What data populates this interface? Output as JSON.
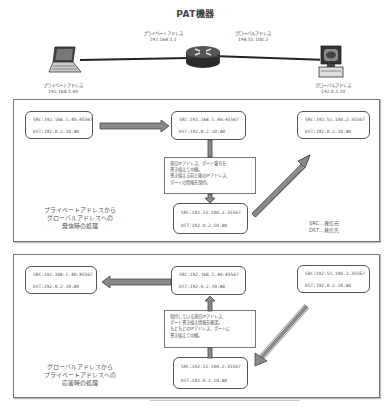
{
  "title": "PAT機器",
  "topology": {
    "router_private": {
      "label": "プライベートアドレス",
      "ip": "192.168.1.1"
    },
    "router_global": {
      "label": "グローバルアドレス",
      "ip": "198.51.100.2"
    },
    "client": {
      "label": "プライベートアドレス",
      "ip": "192.168.1.40"
    },
    "server": {
      "label": "グローバルアドレス",
      "ip": "192.0.2.10"
    }
  },
  "panel_outbound": {
    "caption": [
      "プライベートアドレスから",
      "グローバルアドレスへの",
      "発信時の処理"
    ],
    "box_client": {
      "src": "SRC:192.168.1.40:45567",
      "dst": "DST:192.0.2.10:80"
    },
    "box_router_in": {
      "src": "SRC:192.168.1.40:45567",
      "dst": "DST:192.0.2.10:80"
    },
    "box_router_out": {
      "src": "SRC:192.51.100.2:35567",
      "dst": "DST:192.0.2.10:80"
    },
    "box_server": {
      "src": "SRC:192.51.100.2:35567",
      "dst": "DST:192.0.2.10:80"
    },
    "note": [
      "発信IPアドレス、ポート番号を",
      "書き換えて中継。",
      "書き換える前と後のIPアドレス、",
      "ポートの情報を保持。"
    ],
    "legend": [
      "SRC…発信元",
      "DST…発信先"
    ]
  },
  "panel_inbound": {
    "caption": [
      "グローバルアドレスから",
      "プライベートアドレスへの",
      "応答時の処理"
    ],
    "box_client": {
      "src": "SRC:192.168.1.40:45567",
      "dst": "DST:192.0.2.10:80"
    },
    "box_router_out": {
      "src": "SRC:192.168.1.40:45567",
      "dst": "DST:192.0.2.10:80"
    },
    "box_router_in": {
      "src": "SRC:192.51.100.2:35567",
      "dst": "DST:192.0.2.10:80"
    },
    "box_server": {
      "src": "SRC:192.51.100.2:35567",
      "dst": "DST:192.0.2.10:80"
    },
    "note": [
      "保持している発信IPアドレス、",
      "ポート書き換え情報を確認。",
      "もともとのIPアドレス、ポートに",
      "書き換えて中継。"
    ]
  },
  "colors": {
    "arrow_fill": "#8a8a8a",
    "arrow_stroke": "#444444",
    "panel_border": "#777777"
  }
}
